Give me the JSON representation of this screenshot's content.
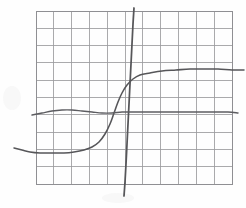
{
  "figure": {
    "title": "",
    "kind": "hand-drawn-graph-sketch",
    "background_color": "#fefefe",
    "grid_color": "#9b9b9e",
    "curve_color": "#565659"
  },
  "grid": {
    "left": 36,
    "top": 11,
    "right": 232,
    "bottom": 184,
    "columns": 11,
    "rows": 10,
    "cell_width": 17.8,
    "cell_height": 17.3,
    "show_border": true
  },
  "chart_data": {
    "type": "line",
    "title": "",
    "xlabel": "",
    "ylabel": "",
    "xlim": [
      36,
      232
    ],
    "ylim": [
      184,
      11
    ],
    "grid": true,
    "legend": "none",
    "series": [
      {
        "name": "sigmoid-curve",
        "color": "#565659",
        "stroke_width": 1.55,
        "description": "S-shaped saturating curve rising left-to-right, low plateau then steep knee then high plateau",
        "points": [
          [
            14,
            148
          ],
          [
            22,
            150
          ],
          [
            30,
            152
          ],
          [
            40,
            153
          ],
          [
            52,
            153
          ],
          [
            64,
            153
          ],
          [
            74,
            152
          ],
          [
            84,
            150
          ],
          [
            92,
            147
          ],
          [
            99,
            142
          ],
          [
            105,
            134
          ],
          [
            110,
            124
          ],
          [
            114,
            113
          ],
          [
            118,
            102
          ],
          [
            122,
            93
          ],
          [
            127,
            85
          ],
          [
            133,
            79
          ],
          [
            140,
            75
          ],
          [
            150,
            73
          ],
          [
            162,
            71
          ],
          [
            176,
            70
          ],
          [
            190,
            69
          ],
          [
            204,
            69
          ],
          [
            218,
            69
          ],
          [
            232,
            70
          ],
          [
            244,
            70
          ]
        ]
      },
      {
        "name": "steep-vertical-line",
        "color": "#565659",
        "stroke_width": 1.75,
        "description": "Near-vertical slightly left-leaning line crossing the whole plot, extends above and below the grid",
        "points": [
          [
            134,
            8
          ],
          [
            133,
            24
          ],
          [
            132,
            44
          ],
          [
            131,
            64
          ],
          [
            130,
            84
          ],
          [
            129,
            104
          ],
          [
            128,
            124
          ],
          [
            127,
            144
          ],
          [
            126,
            164
          ],
          [
            125,
            182
          ],
          [
            124,
            196
          ]
        ]
      },
      {
        "name": "flat-wavy-line",
        "color": "#5d5d61",
        "stroke_width": 1.4,
        "description": "Nearly horizontal gently undulating line across the middle of the plot",
        "points": [
          [
            32,
            115
          ],
          [
            42,
            113
          ],
          [
            52,
            111
          ],
          [
            62,
            110
          ],
          [
            72,
            110
          ],
          [
            82,
            111
          ],
          [
            92,
            112
          ],
          [
            102,
            113
          ],
          [
            112,
            113
          ],
          [
            122,
            112
          ],
          [
            132,
            112
          ],
          [
            146,
            112
          ],
          [
            162,
            112
          ],
          [
            180,
            112
          ],
          [
            198,
            112
          ],
          [
            214,
            112
          ],
          [
            228,
            112
          ],
          [
            238,
            113
          ]
        ]
      }
    ]
  }
}
